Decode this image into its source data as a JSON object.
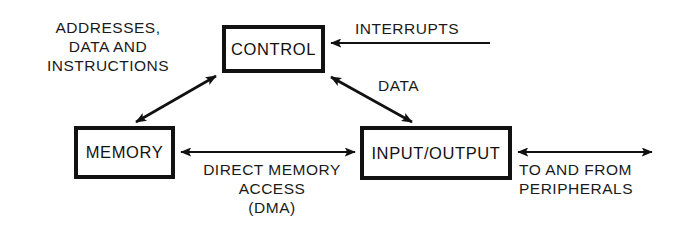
{
  "diagram": {
    "background_color": "#ffffff",
    "line_color": "#111111",
    "text_color": "#1a1a1a",
    "nodes": [
      {
        "id": "control",
        "label": "CONTROL",
        "x": 222,
        "y": 25,
        "width": 103,
        "height": 48
      },
      {
        "id": "memory",
        "label": "MEMORY",
        "x": 74,
        "y": 126,
        "width": 101,
        "height": 53
      },
      {
        "id": "io",
        "label": "INPUT/OUTPUT",
        "x": 360,
        "y": 126,
        "width": 152,
        "height": 54
      }
    ],
    "captions": [
      {
        "id": "addresses",
        "text": "ADDRESSES,\nDATA AND\nINSTRUCTIONS"
      },
      {
        "id": "interrupts",
        "text": "INTERRUPTS"
      },
      {
        "id": "data",
        "text": "DATA"
      },
      {
        "id": "dma",
        "text": "DIRECT MEMORY\nACCESS\n(DMA)"
      },
      {
        "id": "peripherals",
        "text": "TO AND FROM\nPERIPHERALS"
      }
    ],
    "connections": [
      {
        "id": "control-memory",
        "from": "control",
        "to": "memory",
        "label": "ADDRESSES, DATA AND INSTRUCTIONS",
        "arrowheads": "both",
        "orientation": "diagonal"
      },
      {
        "id": "control-io",
        "from": "control",
        "to": "io",
        "label": "DATA",
        "arrowheads": "both",
        "orientation": "diagonal"
      },
      {
        "id": "interrupts-control",
        "from": "external",
        "to": "control",
        "label": "INTERRUPTS",
        "arrowheads": "to-control",
        "orientation": "horizontal"
      },
      {
        "id": "memory-io",
        "from": "memory",
        "to": "io",
        "label": "DIRECT MEMORY ACCESS (DMA)",
        "arrowheads": "both",
        "orientation": "horizontal"
      },
      {
        "id": "io-peripherals",
        "from": "io",
        "to": "peripherals",
        "label": "TO AND FROM PERIPHERALS",
        "arrowheads": "both",
        "orientation": "horizontal"
      }
    ]
  }
}
